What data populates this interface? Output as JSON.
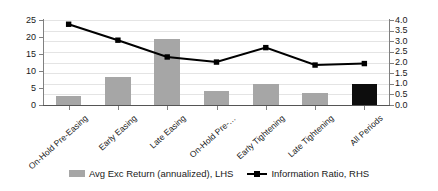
{
  "chart_data": {
    "type": "bar",
    "title": "",
    "subtitle": "",
    "xlabel": "",
    "ylabel": "",
    "grid": true,
    "legend_position": "bottom",
    "categories": [
      "On-Hold Pre-Easing",
      "Early Easing",
      "Late Easing",
      "On-Hold Pre-…",
      "Early Tightening",
      "Late Tightening",
      "All Periods"
    ],
    "axes": {
      "left": {
        "label": "Avg Exc Return (annualized), LHS",
        "min": 0,
        "max": 25,
        "step": 5,
        "ticks": [
          "0",
          "5",
          "10",
          "15",
          "20",
          "25"
        ]
      },
      "right": {
        "label": "Information Ratio, RHS",
        "min": 0.0,
        "max": 4.0,
        "step": 0.5,
        "ticks": [
          "0.0",
          "0.5",
          "1.0",
          "1.5",
          "2.0",
          "2.5",
          "3.0",
          "3.5",
          "4.0"
        ]
      }
    },
    "series": [
      {
        "name": "Avg Exc Return (annualized), LHS",
        "type": "bar",
        "axis": "left",
        "color": "#a6a6a6",
        "highlight_color": "#0d0d0d",
        "highlight_index": 6,
        "values": [
          2.6,
          8.2,
          19.5,
          4.1,
          6.3,
          3.4,
          6.1
        ]
      },
      {
        "name": "Information Ratio, RHS",
        "type": "line",
        "axis": "right",
        "color": "#000000",
        "marker": "square",
        "values": [
          3.8,
          3.05,
          2.26,
          2.02,
          2.7,
          1.88,
          1.95
        ]
      }
    ]
  },
  "legend": {
    "items": [
      {
        "label": "Avg Exc Return (annualized), LHS",
        "marker": "bar-swatch"
      },
      {
        "label": "Information Ratio, RHS",
        "marker": "line-marker"
      }
    ]
  }
}
